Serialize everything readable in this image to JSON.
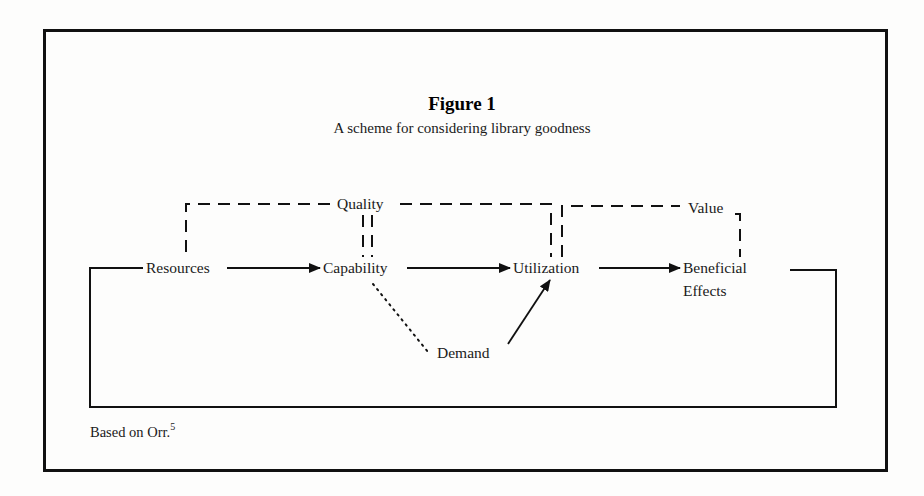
{
  "figure": {
    "title": "Figure 1",
    "subtitle": "A scheme for considering library goodness",
    "source_note": "Based on Orr.",
    "source_superscript": "5"
  },
  "nodes": {
    "resources": "Resources",
    "capability": "Capability",
    "utilization": "Utilization",
    "beneficial_line1": "Beneficial",
    "beneficial_line2": "Effects",
    "demand": "Demand",
    "quality": "Quality",
    "value": "Value"
  },
  "edges": [
    {
      "from": "Resources",
      "to": "Capability",
      "style": "solid-arrow"
    },
    {
      "from": "Capability",
      "to": "Utilization",
      "style": "solid-arrow"
    },
    {
      "from": "Utilization",
      "to": "Beneficial Effects",
      "style": "solid-arrow"
    },
    {
      "from": "Demand",
      "to": "Utilization",
      "style": "solid-arrow"
    },
    {
      "from": "Capability",
      "to": "Demand",
      "style": "dotted"
    },
    {
      "from": "Beneficial Effects",
      "to": "Resources",
      "style": "solid-feedback-loop"
    },
    {
      "from": "Resources",
      "to": "Capability",
      "label": "Quality",
      "style": "dashed-bracket"
    },
    {
      "from": "Capability",
      "to": "Utilization",
      "label": "Quality",
      "style": "dashed-bracket"
    },
    {
      "from": "Utilization",
      "to": "Beneficial Effects",
      "label": "Value",
      "style": "dashed-bracket"
    }
  ]
}
